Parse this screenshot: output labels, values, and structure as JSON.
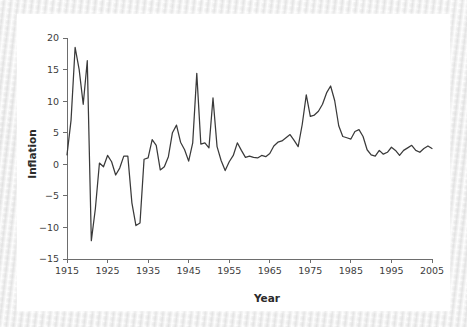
{
  "figure": {
    "background_color": "#ffffff",
    "page_color": "#efefef",
    "line_color": "#3a3a3a",
    "axis_color": "#6d6d6d"
  },
  "axis_titles": {
    "x": "Year",
    "y": "Inflation"
  },
  "ticks": {
    "x_labels": [
      "1915",
      "1925",
      "1935",
      "1945",
      "1955",
      "1965",
      "1975",
      "1985",
      "1995",
      "2005"
    ],
    "y_labels": [
      "20",
      "15",
      "10",
      "5",
      "0",
      "−5",
      "−10",
      "−15"
    ]
  },
  "chart_data": {
    "type": "line",
    "title": "",
    "subtitle": "",
    "xlabel": "Year",
    "ylabel": "Inflation",
    "xlim": [
      1915,
      2005
    ],
    "ylim": [
      -15,
      20
    ],
    "xticks": [
      1915,
      1925,
      1935,
      1945,
      1955,
      1965,
      1975,
      1985,
      1995,
      2005
    ],
    "yticks": [
      -15,
      -10,
      -5,
      0,
      5,
      10,
      15,
      20
    ],
    "grid": false,
    "legend": false,
    "legend_position": "none",
    "annotations": [],
    "series": [
      {
        "name": "Inflation",
        "color": "#3a3a3a",
        "x": [
          1915,
          1916,
          1917,
          1918,
          1919,
          1920,
          1921,
          1922,
          1923,
          1924,
          1925,
          1926,
          1927,
          1928,
          1929,
          1930,
          1931,
          1932,
          1933,
          1934,
          1935,
          1936,
          1937,
          1938,
          1939,
          1940,
          1941,
          1942,
          1943,
          1944,
          1945,
          1946,
          1947,
          1948,
          1949,
          1950,
          1951,
          1952,
          1953,
          1954,
          1955,
          1956,
          1957,
          1958,
          1959,
          1960,
          1961,
          1962,
          1963,
          1964,
          1965,
          1966,
          1967,
          1968,
          1969,
          1970,
          1971,
          1972,
          1973,
          1974,
          1975,
          1976,
          1977,
          1978,
          1979,
          1980,
          1981,
          1982,
          1983,
          1984,
          1985,
          1986,
          1987,
          1988,
          1989,
          1990,
          1991,
          1992,
          1993,
          1994,
          1995,
          1996,
          1997,
          1998,
          1999,
          2000,
          2001,
          2002,
          2003,
          2004,
          2005
        ],
        "y": [
          1.5,
          7.0,
          18.5,
          15.0,
          9.5,
          16.4,
          -12.1,
          -7.0,
          0.2,
          -0.4,
          1.4,
          0.4,
          -1.7,
          -0.6,
          1.3,
          1.3,
          -6.1,
          -9.7,
          -9.3,
          0.8,
          1.0,
          3.9,
          3.0,
          -0.9,
          -0.4,
          1.2,
          5.0,
          6.2,
          3.5,
          2.3,
          0.5,
          3.4,
          14.4,
          3.2,
          3.4,
          2.6,
          10.5,
          2.8,
          0.6,
          -1.0,
          0.4,
          1.4,
          3.4,
          2.2,
          1.1,
          1.3,
          1.1,
          1.0,
          1.4,
          1.2,
          1.7,
          2.9,
          3.5,
          3.7,
          4.2,
          4.7,
          3.8,
          2.8,
          6.3,
          11.0,
          7.6,
          7.8,
          8.4,
          9.5,
          11.3,
          12.4,
          10.1,
          6.1,
          4.4,
          4.2,
          4.0,
          5.2,
          5.5,
          4.4,
          2.3,
          1.5,
          1.3,
          2.2,
          1.6,
          1.9,
          2.7,
          2.2,
          1.4,
          2.2,
          2.6,
          3.0,
          2.2,
          1.9,
          2.5,
          2.9,
          2.5
        ]
      }
    ]
  }
}
